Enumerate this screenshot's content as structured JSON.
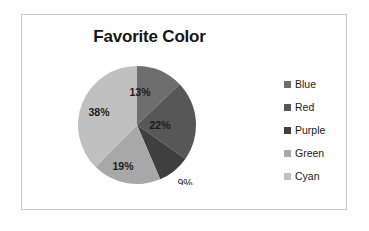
{
  "chart_data": {
    "type": "pie",
    "title": "Favorite Color",
    "xlabel": "",
    "ylabel": "",
    "legend_position": "right",
    "grid": false,
    "categories": [
      "Blue",
      "Red",
      "Purple",
      "Green",
      "Cyan"
    ],
    "values": [
      13,
      22,
      9,
      19,
      38
    ],
    "data_labels": [
      "13%",
      "22%",
      "9%",
      "19%",
      "38%"
    ],
    "start_angle_deg": 0,
    "direction": "clockwise",
    "slice_colors": [
      "#6e6e6e",
      "#575757",
      "#3f3f3f",
      "#a8a8a8",
      "#c0c0c0"
    ],
    "legend_entries": [
      {
        "label": "Blue",
        "color": "#6e6e6e",
        "value": 13,
        "data_label": "13%"
      },
      {
        "label": "Red",
        "color": "#575757",
        "value": 22,
        "data_label": "22%"
      },
      {
        "label": "Purple",
        "color": "#3f3f3f",
        "value": 9,
        "data_label": "9%"
      },
      {
        "label": "Green",
        "color": "#a8a8a8",
        "value": 19,
        "data_label": "19%"
      },
      {
        "label": "Cyan",
        "color": "#c0c0c0",
        "value": 38,
        "data_label": "38%"
      }
    ]
  },
  "frame": {
    "border_color": "#c8c8c8",
    "background": "#ffffff"
  }
}
